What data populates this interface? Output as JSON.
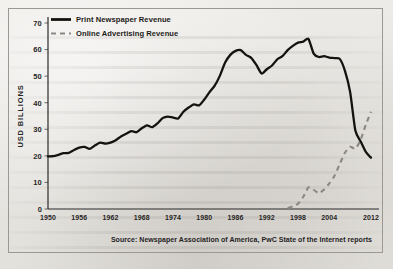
{
  "figure": {
    "source_note": "Source: Newspaper Association of America, PwC State of the Internet reports",
    "border_color": "#9b9792",
    "background_color": "#e9e7e3"
  },
  "legend": {
    "position": "top-left",
    "entries": [
      {
        "label": "Print Newspaper Revenue",
        "style": "solid",
        "color": "#15130f"
      },
      {
        "label": "Online Advertising Revenue",
        "style": "dashed",
        "color": "#8b8884"
      }
    ]
  },
  "chart_data": {
    "type": "line",
    "title": "",
    "xlabel": "",
    "ylabel": "USD BILLIONS",
    "xlim": [
      1950,
      2012
    ],
    "ylim": [
      0,
      70
    ],
    "grid": false,
    "ytick_labels": [
      "70",
      "60",
      "50",
      "40",
      "30",
      "20",
      "10",
      "0"
    ],
    "ytick_values": [
      70,
      60,
      50,
      40,
      30,
      20,
      10,
      0
    ],
    "xtick_labels": [
      "1950",
      "1956",
      "1962",
      "1968",
      "1974",
      "1980",
      "1986",
      "1992",
      "1998",
      "2004",
      "2012"
    ],
    "xtick_values": [
      1950,
      1956,
      1962,
      1968,
      1974,
      1980,
      1986,
      1992,
      1998,
      2004,
      2012
    ],
    "series": [
      {
        "name": "Print Newspaper Revenue",
        "style": "solid",
        "color": "#15130f",
        "x": [
          1950,
          1951,
          1952,
          1953,
          1954,
          1955,
          1956,
          1957,
          1958,
          1959,
          1960,
          1961,
          1962,
          1963,
          1964,
          1965,
          1966,
          1967,
          1968,
          1969,
          1970,
          1971,
          1972,
          1973,
          1974,
          1975,
          1976,
          1977,
          1978,
          1979,
          1980,
          1981,
          1982,
          1983,
          1984,
          1985,
          1986,
          1987,
          1988,
          1989,
          1990,
          1991,
          1992,
          1993,
          1994,
          1995,
          1996,
          1997,
          1998,
          1999,
          2000,
          2001,
          2002,
          2003,
          2004,
          2005,
          2006,
          2007,
          2008,
          2009,
          2010,
          2011,
          2012
        ],
        "values": [
          19.8,
          19.9,
          20.4,
          21.0,
          21.1,
          22.2,
          23.1,
          23.4,
          22.6,
          23.9,
          25.0,
          24.6,
          25.0,
          25.9,
          27.3,
          28.3,
          29.3,
          28.9,
          30.4,
          31.5,
          30.8,
          32.2,
          34.2,
          34.8,
          34.4,
          34.1,
          36.6,
          38.2,
          39.4,
          39.0,
          41.2,
          44.0,
          46.4,
          50.2,
          55.1,
          58.0,
          59.5,
          59.8,
          58.0,
          56.9,
          54.2,
          51.0,
          52.6,
          54.0,
          56.3,
          57.5,
          59.8,
          61.4,
          62.6,
          63.0,
          64.0,
          58.5,
          57.2,
          57.5,
          57.0,
          56.8,
          56.5,
          52.0,
          44.0,
          29.5,
          25.5,
          21.5,
          19.3
        ]
      },
      {
        "name": "Online Advertising Revenue",
        "style": "dashed",
        "color": "#8b8884",
        "x": [
          1996,
          1997,
          1998,
          1999,
          2000,
          2001,
          2002,
          2003,
          2004,
          2005,
          2006,
          2007,
          2008,
          2009,
          2010,
          2011,
          2012
        ],
        "values": [
          0.3,
          1.0,
          2.0,
          4.6,
          8.1,
          7.2,
          6.0,
          7.3,
          9.6,
          12.5,
          16.9,
          21.2,
          23.4,
          22.7,
          26.0,
          31.7,
          36.6
        ]
      }
    ]
  }
}
